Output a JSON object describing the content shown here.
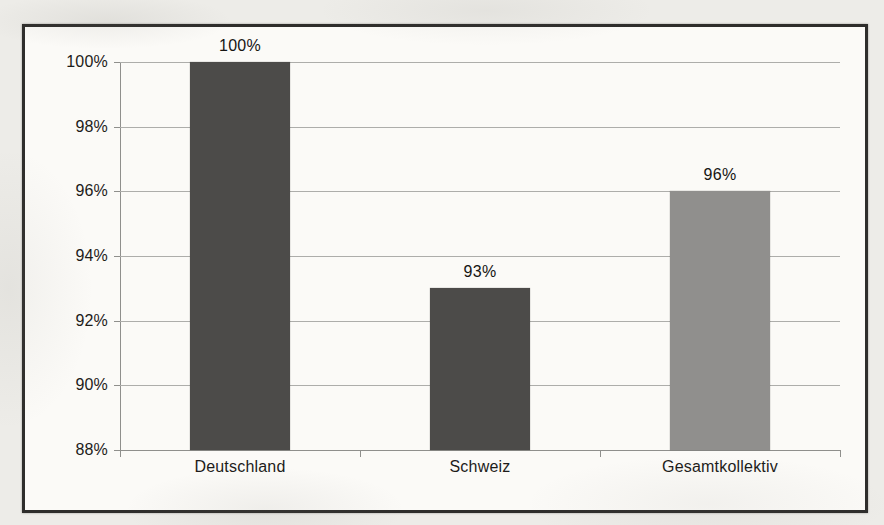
{
  "page": {
    "background_color": "#edece8",
    "figure_background": "#fbfaf7",
    "figure_border_color": "#2e2d2b"
  },
  "colors": {
    "gridline": "#adadaa",
    "axis": "#8f8f8c",
    "text": "#1d1c1a"
  },
  "chart_data": {
    "type": "bar",
    "title": "",
    "xlabel": "",
    "ylabel": "",
    "categories": [
      "Deutschland",
      "Schweiz",
      "Gesamtkollektiv"
    ],
    "values": [
      100,
      93,
      96
    ],
    "value_labels": [
      "100%",
      "93%",
      "96%"
    ],
    "bar_colors": [
      "#4c4b49",
      "#4c4b49",
      "#908f8d"
    ],
    "ylim": [
      88,
      100
    ],
    "ytick_step": 2,
    "yticks": [
      {
        "value": 100,
        "label": "100%"
      },
      {
        "value": 98,
        "label": "98%"
      },
      {
        "value": 96,
        "label": "96%"
      },
      {
        "value": 94,
        "label": "94%"
      },
      {
        "value": 92,
        "label": "92%"
      },
      {
        "value": 90,
        "label": "90%"
      },
      {
        "value": 88,
        "label": "88%"
      }
    ],
    "grid": "horizontal",
    "legend": "none"
  }
}
